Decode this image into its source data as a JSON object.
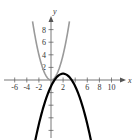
{
  "chart_data": {
    "type": "line",
    "title": "",
    "xlabel": "x",
    "ylabel": "y",
    "xlim": [
      -7,
      12
    ],
    "ylim": [
      -9,
      10
    ],
    "grid": false,
    "x_ticks": [
      -6,
      -4,
      -2,
      2,
      4,
      6,
      8,
      10
    ],
    "x_tick_labels": [
      "-6",
      "-4",
      "-2",
      "2",
      "6",
      "8",
      "10"
    ],
    "y_ticks": [
      -8,
      -6,
      -4,
      -2,
      2,
      4,
      6,
      8
    ],
    "y_tick_labels": [
      "2",
      "4",
      "6",
      "8"
    ],
    "series": [
      {
        "name": "f(x) = x^2",
        "color": "#9a9a9a",
        "equation": "y = x^2",
        "x": [
          -3,
          -2,
          -1,
          0,
          1,
          2,
          3
        ],
        "values": [
          9,
          4,
          1,
          0,
          1,
          4,
          9
        ]
      },
      {
        "name": "g(x) = -1/2(x-2)^2 + 1",
        "color": "#000000",
        "equation": "y = -0.5(x-2)^2 + 1",
        "x": [
          -2.5,
          -1,
          0,
          1,
          2,
          3,
          4,
          5,
          6.5
        ],
        "values": [
          -9.1,
          -3.5,
          -1,
          0.5,
          1,
          0.5,
          -1,
          -3.5,
          -9.1
        ]
      }
    ]
  },
  "axes": {
    "x_label": "x",
    "y_label": "y"
  }
}
